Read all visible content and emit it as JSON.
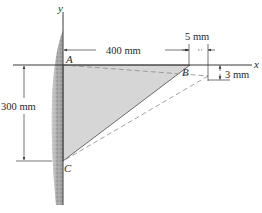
{
  "diagram": {
    "axes": {
      "x_label": "x",
      "y_label": "y"
    },
    "points": {
      "A": "A",
      "B": "B",
      "C": "C"
    },
    "dimensions": {
      "horizontal_AB": "400 mm",
      "vertical_AC": "300 mm",
      "displacement_x": "5 mm",
      "displacement_y": "3 mm"
    },
    "colors": {
      "triangle_fill": "#d6d6d6",
      "wall": "#9a9a9a",
      "lines": "#3a3a3a",
      "dashed": "#8a8a8a"
    }
  }
}
